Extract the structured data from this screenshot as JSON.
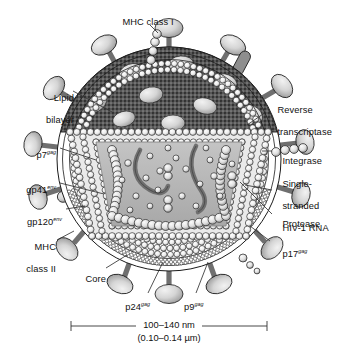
{
  "figure": {
    "scale_bar": {
      "primary": "100–140 nm",
      "secondary": "(0.10–0.14 µm)"
    }
  },
  "labels": {
    "mhc_class_i": {
      "text": "MHC class I",
      "sup": ""
    },
    "lipid_bilayer": {
      "line1": "Lipid",
      "line2": "bilayer"
    },
    "p7": {
      "text": "p7",
      "sup": "gag"
    },
    "gp41": {
      "text": "gp41",
      "sup": "env"
    },
    "gp120": {
      "text": "gp120",
      "sup": "env"
    },
    "mhc_class_ii": {
      "line1": "MHC",
      "line2": "class II"
    },
    "core": {
      "text": "Core",
      "sup": ""
    },
    "p24": {
      "text": "p24",
      "sup": "gag"
    },
    "p9": {
      "text": "p9",
      "sup": "gag"
    },
    "reverse_transcriptase": {
      "line1": "Reverse",
      "line2": "transcriptase"
    },
    "integrase": {
      "text": "Integrase",
      "sup": ""
    },
    "ss_rna": {
      "line1": "Single-",
      "line2": "stranded",
      "line3": "HIV-1 RNA"
    },
    "protease": {
      "text": "Protease",
      "sup": ""
    },
    "p17": {
      "text": "p17",
      "sup": "gag"
    }
  },
  "colors": {
    "envelope_cap": "#5a5a5a",
    "knob_light": "#d8d8d8",
    "knob_dark": "#9a9a9a",
    "matrix_bead": "#ffffff",
    "capsid_fill": "#e2e2e2",
    "core_fill": "#b6b6b6",
    "rna_strand": "#6b6b6b",
    "stalk": "#7a7a7a",
    "outline": "#1a1a1a",
    "leader": "#333333"
  }
}
